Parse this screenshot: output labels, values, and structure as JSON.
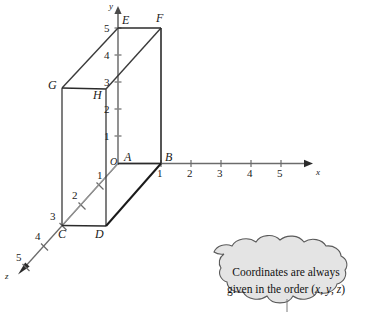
{
  "figure": {
    "axes": [
      {
        "name": "x",
        "label": "x",
        "direction": "right",
        "ticks": [
          "1",
          "2",
          "3",
          "4",
          "5"
        ]
      },
      {
        "name": "y",
        "label": "y",
        "direction": "up",
        "ticks": [
          "1",
          "2",
          "3",
          "4",
          "5"
        ]
      },
      {
        "name": "z",
        "label": "z",
        "direction": "down-left",
        "ticks": [
          "1",
          "2",
          "3",
          "4",
          "5"
        ]
      }
    ],
    "origin_label": "O",
    "vertices": [
      {
        "id": "A",
        "label": "A"
      },
      {
        "id": "B",
        "label": "B"
      },
      {
        "id": "C",
        "label": "C"
      },
      {
        "id": "D",
        "label": "D"
      },
      {
        "id": "E",
        "label": "E"
      },
      {
        "id": "F",
        "label": "F"
      },
      {
        "id": "G",
        "label": "G"
      },
      {
        "id": "H",
        "label": "H"
      }
    ],
    "colors": {
      "axis": "#6b6b6b",
      "solid_edge": "#1a1a1a",
      "hidden_edge": "#8a8a8a",
      "bubble_fill": "#e4e4e4",
      "bubble_stroke": "#4a4a4a",
      "text": "#1a1a1a"
    }
  },
  "x_ticks": {
    "t1": "1",
    "t2": "2",
    "t3": "3",
    "t4": "4",
    "t5": "5"
  },
  "y_ticks": {
    "t1": "1",
    "t2": "2",
    "t3": "3",
    "t4": "4",
    "t5": "5"
  },
  "z_ticks": {
    "t1": "1",
    "t2": "2",
    "t3": "3",
    "t4": "4",
    "t5": "5"
  },
  "axis_labels": {
    "x": "x",
    "y": "y",
    "z": "z"
  },
  "points": {
    "O": "O",
    "A": "A",
    "B": "B",
    "C": "C",
    "D": "D",
    "E": "E",
    "F": "F",
    "G": "G",
    "H": "H"
  },
  "callout": {
    "line1": "Coordinates are always",
    "line2_prefix": "given in the order (",
    "line2_x": "x",
    "line2_sep1": ", ",
    "line2_y": "y",
    "line2_sep2": ", ",
    "line2_z": "z",
    "line2_suffix": ")"
  }
}
